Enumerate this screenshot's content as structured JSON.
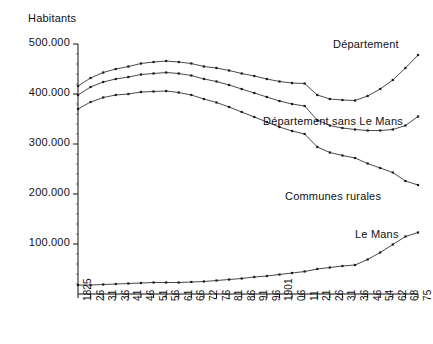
{
  "chart_data": {
    "type": "line",
    "title": "",
    "ylabel": "Habitants",
    "xlabel": "",
    "grid": false,
    "legend_position": "inline-at-series-end",
    "ylim": [
      0,
      520000
    ],
    "yticks": [
      100000,
      200000,
      300000,
      400000,
      500000
    ],
    "ytick_labels": [
      "100.000",
      "200.000",
      "300.000",
      "400.000",
      "500.000"
    ],
    "categories": [
      "1825",
      "26",
      "31",
      "36",
      "41",
      "46",
      "51",
      "56",
      "61",
      "66",
      "72",
      "76",
      "81",
      "86",
      "91",
      "96",
      "1901",
      "06",
      "11",
      "21",
      "26",
      "31",
      "36",
      "46",
      "54",
      "62",
      "68",
      "75"
    ],
    "series": [
      {
        "name": "Département",
        "label": "Département",
        "color": "#1a1a1a",
        "values": [
          416000,
          432000,
          443000,
          450000,
          455000,
          461000,
          464000,
          466000,
          464000,
          461000,
          455000,
          452000,
          447000,
          441000,
          436000,
          430000,
          425000,
          422000,
          421000,
          398000,
          390000,
          388000,
          387000,
          396000,
          410000,
          428000,
          452000,
          478000
        ]
      },
      {
        "name": "Département sans Le Mans",
        "label": "Département sans Le Mans",
        "color": "#1a1a1a",
        "values": [
          398000,
          414000,
          424000,
          430000,
          434000,
          439000,
          441000,
          443000,
          441000,
          437000,
          430000,
          425000,
          418000,
          410000,
          402000,
          394000,
          386000,
          380000,
          376000,
          348000,
          337000,
          332000,
          329000,
          327000,
          327000,
          329000,
          337000,
          355000
        ]
      },
      {
        "name": "Communes rurales",
        "label": "Communes rurales",
        "color": "#1a1a1a",
        "values": [
          370000,
          384000,
          393000,
          398000,
          400000,
          404000,
          405000,
          406000,
          403000,
          398000,
          390000,
          383000,
          374000,
          364000,
          354000,
          344000,
          334000,
          326000,
          320000,
          294000,
          283000,
          277000,
          272000,
          261000,
          252000,
          243000,
          226000,
          218000
        ]
      },
      {
        "name": "Le Mans",
        "label": "Le Mans",
        "color": "#1a1a1a",
        "values": [
          18000,
          18000,
          19000,
          20000,
          21000,
          22000,
          23000,
          23000,
          23000,
          24000,
          25000,
          27000,
          29000,
          31000,
          34000,
          36000,
          39000,
          42000,
          45000,
          50000,
          53000,
          56000,
          58000,
          69000,
          83000,
          99000,
          115000,
          123000
        ]
      }
    ]
  },
  "axes": {
    "y_axis_name": "habitants-axis",
    "x_axis_name": "year-axis"
  }
}
